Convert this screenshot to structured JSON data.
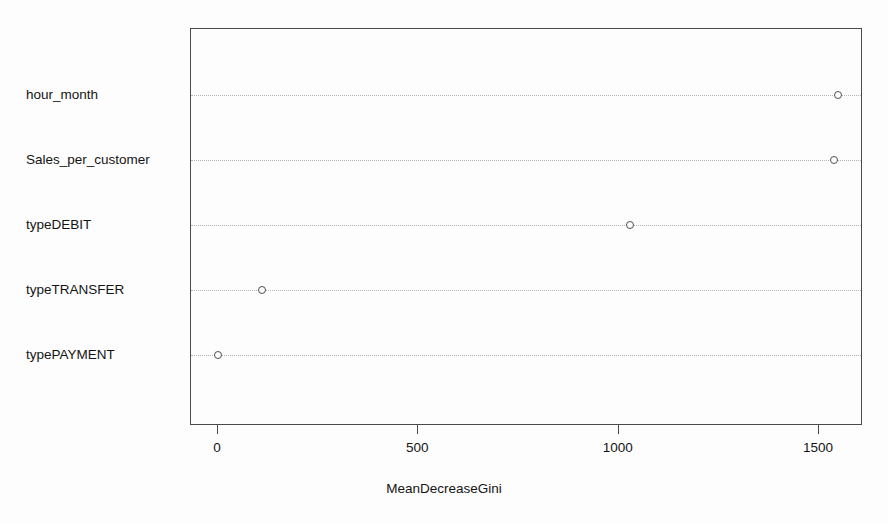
{
  "chart_data": {
    "type": "scatter",
    "subtype": "dotchart-variable-importance",
    "title": "",
    "xlabel": "MeanDecreaseGini",
    "ylabel": "",
    "categories": [
      "hour_month",
      "Sales_per_customer",
      "typeDEBIT",
      "typeTRANSFER",
      "typePAYMENT"
    ],
    "values": [
      1550,
      1540,
      1031,
      112,
      2
    ],
    "xlim": [
      -55,
      1620
    ],
    "xticks": [
      0,
      500,
      1000,
      1500
    ],
    "xtick_labels": [
      "0",
      "500",
      "1000",
      "1500"
    ],
    "grid": "horizontal-dotted",
    "legend": null,
    "marker": "open-circle",
    "point_color": "#4f4f4f",
    "frame_color": "#4a4a4a",
    "grid_color": "#b4b4b4",
    "background": "#fdfdfd",
    "points": [
      {
        "label": "hour_month",
        "value": 1550
      },
      {
        "label": "Sales_per_customer",
        "value": 1540
      },
      {
        "label": "typeDEBIT",
        "value": 1031
      },
      {
        "label": "typeTRANSFER",
        "value": 112
      },
      {
        "label": "typePAYMENT",
        "value": 2
      }
    ]
  },
  "axis": {
    "x_title": "MeanDecreaseGini",
    "tick_labels": [
      "0",
      "500",
      "1000",
      "1500"
    ]
  },
  "labels": {
    "row0": "hour_month",
    "row1": "Sales_per_customer",
    "row2": "typeDEBIT",
    "row3": "typeTRANSFER",
    "row4": "typePAYMENT"
  }
}
